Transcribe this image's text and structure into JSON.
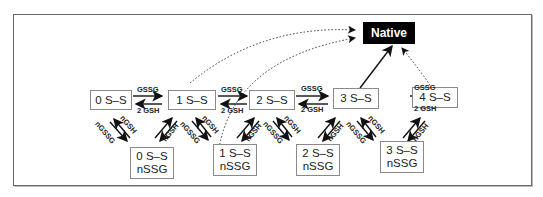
{
  "diagram": {
    "native": "Native",
    "top_states": [
      {
        "label": "0 S–S"
      },
      {
        "label": "1 S–S"
      },
      {
        "label": "2 S–S"
      },
      {
        "label": "3 S–S"
      },
      {
        "label": "4 S–S"
      }
    ],
    "bottom_states": [
      {
        "line1": "0 S–S",
        "line2": "nSSG"
      },
      {
        "line1": "1 S–S",
        "line2": "nSSG"
      },
      {
        "line1": "2 S–S",
        "line2": "nSSG"
      },
      {
        "line1": "3 S–S",
        "line2": "nSSG"
      }
    ],
    "forward_label": "GSSG",
    "reverse_label": "2 GSH",
    "down_label": "nGSSG",
    "down_label_short": "nSSG",
    "up_label": "nGSH"
  }
}
